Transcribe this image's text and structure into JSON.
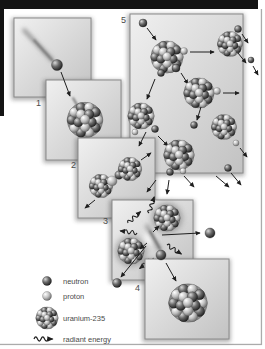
{
  "colors": {
    "top_bar": "#141414",
    "frame_line": "#ababab",
    "panel_border": "#8a8a8a",
    "panel_light": "#f0f0f0",
    "panel_dark": "#c2c2c2",
    "ink": "#1e1e1e",
    "label_text": "#4a4a4a",
    "neutron_sphere": "#1a1a1a",
    "proton_sphere": "#e8e8e8",
    "nucleus_base": "#8f8f8f"
  },
  "panels": [
    {
      "id": "panel-1",
      "number": "1"
    },
    {
      "id": "panel-2",
      "number": "2"
    },
    {
      "id": "panel-3",
      "number": "3"
    },
    {
      "id": "panel-4",
      "number": "4"
    },
    {
      "id": "panel-5",
      "number": "5"
    }
  ],
  "legend": {
    "items": [
      {
        "icon": "neutron-icon",
        "label": "neutron"
      },
      {
        "icon": "proton-icon",
        "label": "proton"
      },
      {
        "icon": "uranium-235-icon",
        "label": "uranium-235"
      },
      {
        "icon": "radiant-energy-icon",
        "label": "radiant energy"
      }
    ]
  }
}
